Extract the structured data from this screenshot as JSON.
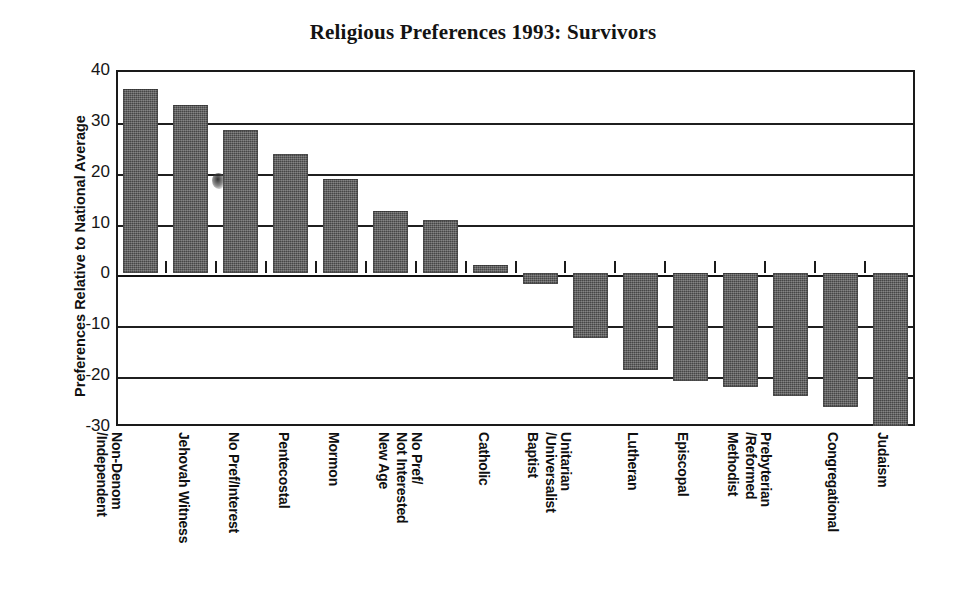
{
  "chart_data": {
    "type": "bar",
    "title": "Religious Preferences 1993: Survivors",
    "xlabel": "",
    "ylabel": "Preferences Relative to National Average",
    "ylim": [
      -30,
      40
    ],
    "ytick_values": [
      40,
      30,
      20,
      10,
      0,
      -10,
      -20,
      -30
    ],
    "ytick_labels": [
      "40",
      "30",
      "20",
      "10",
      "0",
      "-10",
      "-20",
      "-30"
    ],
    "grid": true,
    "legend": "none",
    "bar_color": "#555555",
    "categories": [
      "Non-Denom /Independent",
      "Jehovah Witness",
      "No Pref/Interest",
      "Pentecostal",
      "Mormon",
      "New Age",
      "No Pref/ Not Interested",
      "Catholic",
      "Baptist",
      "Unitarian /Universalist",
      "Lutheran",
      "Episcopal",
      "Methodist",
      "Prebyterian /Reformed",
      "Congregational",
      "Judaism"
    ],
    "category_lines": [
      [
        "Non-Denom",
        "/Independent"
      ],
      [
        "Jehovah Witness",
        ""
      ],
      [
        "No Pref/Interest",
        ""
      ],
      [
        "Pentecostal",
        ""
      ],
      [
        "Mormon",
        ""
      ],
      [
        "New Age",
        ""
      ],
      [
        "No Pref/",
        "Not Interested"
      ],
      [
        "Catholic",
        ""
      ],
      [
        "Baptist",
        ""
      ],
      [
        "Unitarian",
        "/Universalist"
      ],
      [
        "Lutheran",
        ""
      ],
      [
        "Episcopal",
        ""
      ],
      [
        "Methodist",
        ""
      ],
      [
        "Prebyterian",
        "/Reformed"
      ],
      [
        "Congregational",
        ""
      ],
      [
        "Judaism",
        ""
      ]
    ],
    "values": [
      36.2,
      33.1,
      28.3,
      23.5,
      18.5,
      12.3,
      10.6,
      1.7,
      -2.1,
      -12.6,
      -19.0,
      -21.2,
      -22.3,
      -24.1,
      -26.3,
      -30.0
    ]
  },
  "annotations": {
    "scan_smudge": "ink-smudge-artifact"
  }
}
